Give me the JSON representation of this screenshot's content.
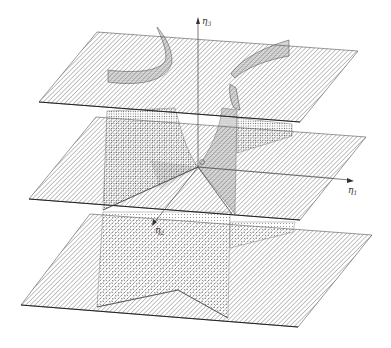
{
  "figure": {
    "type": "3d-surface-diagram",
    "background": "#ffffff",
    "ink": "#333333",
    "axes": {
      "eta1": {
        "label": "η",
        "sub": "1"
      },
      "eta2": {
        "label": "η",
        "sub": "2"
      },
      "eta3": {
        "label": "η",
        "sub": "3"
      },
      "origin": {
        "label": "O"
      }
    },
    "planes": [
      {
        "name": "top-plane",
        "style": "hatched"
      },
      {
        "name": "middle-plane",
        "style": "hatched"
      },
      {
        "name": "bottom-plane",
        "style": "hatched"
      }
    ],
    "surfaces": {
      "style": "stippled"
    }
  }
}
